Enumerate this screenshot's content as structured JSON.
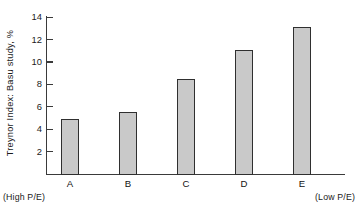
{
  "chart_data": {
    "type": "bar",
    "title": "",
    "subtitle": "",
    "xlabel": "",
    "ylabel": "Treynor Index:  Basu study, %",
    "categories": [
      "A",
      "B",
      "C",
      "D",
      "E"
    ],
    "values": [
      4.9,
      5.5,
      8.5,
      11.1,
      13.1
    ],
    "series": [
      {
        "name": "Treynor Index",
        "values": [
          4.9,
          5.5,
          8.5,
          11.1,
          13.1
        ]
      }
    ],
    "ylim": [
      0,
      14.8
    ],
    "yticks": [
      2,
      4,
      6,
      8,
      10,
      12,
      14
    ],
    "ytick_labels": [
      "2",
      "4",
      "6",
      "8",
      "10",
      "12",
      "14"
    ],
    "grid": false,
    "legend": false,
    "legend_position": "none",
    "annotations": [
      {
        "text": "(High P/E)",
        "position": "bottom-left"
      },
      {
        "text": "(Low P/E)",
        "position": "bottom-right"
      }
    ],
    "bar_fill_color": "#c9c9c9",
    "bar_edge_color": "#2f2f2f",
    "axis_color": "#3a3a3a",
    "background_color": "#ffffff"
  },
  "axis": {
    "y_title": "Treynor Index:  Basu study, %",
    "ticks": [
      {
        "label": "14",
        "value": 14
      },
      {
        "label": "12",
        "value": 12
      },
      {
        "label": "10",
        "value": 10
      },
      {
        "label": "8",
        "value": 8
      },
      {
        "label": "6",
        "value": 6
      },
      {
        "label": "4",
        "value": 4
      },
      {
        "label": "2",
        "value": 2
      }
    ]
  },
  "bars": [
    {
      "label": "A",
      "value": 4.9
    },
    {
      "label": "B",
      "value": 5.5
    },
    {
      "label": "C",
      "value": 8.5
    },
    {
      "label": "D",
      "value": 11.1
    },
    {
      "label": "E",
      "value": 13.1
    }
  ],
  "notes": {
    "left": "(High P/E)",
    "right": "(Low P/E)"
  }
}
